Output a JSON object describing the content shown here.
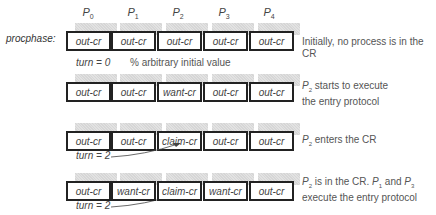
{
  "diagram": {
    "process_labels": [
      {
        "base": "P",
        "sub": "0"
      },
      {
        "base": "P",
        "sub": "1"
      },
      {
        "base": "P",
        "sub": "2"
      },
      {
        "base": "P",
        "sub": "3"
      },
      {
        "base": "P",
        "sub": "4"
      }
    ],
    "row_label": "procphase:",
    "rows": [
      {
        "cells": [
          "out-cr",
          "out-cr",
          "out-cr",
          "out-cr",
          "out-cr"
        ],
        "description_lines": [
          "Initially, no process is in the CR"
        ]
      },
      {
        "cells": [
          "out-cr",
          "out-cr",
          "want-cr",
          "out-cr",
          "out-cr"
        ],
        "description_prefix": {
          "base": "P",
          "sub": "2"
        },
        "description_lines": [
          " starts to execute",
          "the entry protocol"
        ]
      },
      {
        "cells": [
          "out-cr",
          "out-cr",
          "claim-cr",
          "out-cr",
          "out-cr"
        ],
        "description_prefix": {
          "base": "P",
          "sub": "2"
        },
        "description_lines": [
          " enters the CR"
        ]
      },
      {
        "cells": [
          "out-cr",
          "want-cr",
          "claim-cr",
          "want-cr",
          "out-cr"
        ],
        "description_prefix": {
          "base": "P",
          "sub": "2"
        },
        "description_line1_rest": " is in the CR. ",
        "p1": {
          "base": "P",
          "sub": "1"
        },
        "and_text": " and ",
        "p3": {
          "base": "P",
          "sub": "3"
        },
        "description_line2": "execute the entry protocol"
      }
    ],
    "turn_annotations": [
      {
        "text": "turn = 0",
        "comment": "% arbitrary initial value"
      },
      {
        "text": "turn = 2"
      },
      {
        "text": "turn = 2"
      }
    ]
  }
}
